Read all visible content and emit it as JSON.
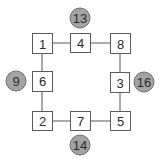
{
  "diagram": {
    "type": "puzzle-grid",
    "colors": {
      "box_border": "#5a5a5a",
      "box_fill": "#ffffff",
      "circle_fill": "#a3a3a3",
      "circle_border": "#6e6e6e",
      "edge": "#555555",
      "text": "#2a2a2a"
    },
    "boxes": [
      {
        "id": "b1",
        "label": "1",
        "x": 32,
        "y": 33
      },
      {
        "id": "b4",
        "label": "4",
        "x": 70,
        "y": 33
      },
      {
        "id": "b8",
        "label": "8",
        "x": 110,
        "y": 33
      },
      {
        "id": "b6",
        "label": "6",
        "x": 32,
        "y": 71
      },
      {
        "id": "b3",
        "label": "3",
        "x": 110,
        "y": 72
      },
      {
        "id": "b2",
        "label": "2",
        "x": 32,
        "y": 111
      },
      {
        "id": "b7",
        "label": "7",
        "x": 70,
        "y": 111
      },
      {
        "id": "b5",
        "label": "5",
        "x": 110,
        "y": 111
      }
    ],
    "circles": [
      {
        "id": "c_top",
        "label": "13",
        "cx": 80,
        "cy": 18
      },
      {
        "id": "c_left",
        "label": "9",
        "cx": 16,
        "cy": 81
      },
      {
        "id": "c_right",
        "label": "16",
        "cx": 144,
        "cy": 82
      },
      {
        "id": "c_bottom",
        "label": "14",
        "cx": 80,
        "cy": 145
      }
    ],
    "edges": [
      [
        "1",
        "4"
      ],
      [
        "4",
        "8"
      ],
      [
        "8",
        "3"
      ],
      [
        "3",
        "5"
      ],
      [
        "5",
        "7"
      ],
      [
        "7",
        "2"
      ],
      [
        "2",
        "6"
      ],
      [
        "6",
        "1"
      ]
    ],
    "sides": {
      "top": {
        "sum": "13",
        "members": [
          "1",
          "4",
          "8"
        ]
      },
      "left": {
        "sum": "9",
        "members": [
          "1",
          "6",
          "2"
        ]
      },
      "right": {
        "sum": "16",
        "members": [
          "8",
          "3",
          "5"
        ]
      },
      "bottom": {
        "sum": "14",
        "members": [
          "2",
          "7",
          "5"
        ]
      }
    }
  }
}
